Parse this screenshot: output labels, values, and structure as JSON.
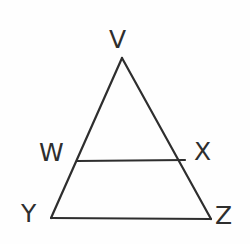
{
  "figure": {
    "kind": "geometry-diagram",
    "background_color": "#fefefe",
    "stroke_color": "#2e2e2e",
    "stroke_width": 2,
    "label_color": "#2e2e2e",
    "label_font_size": 25,
    "canvas": {
      "width": 250,
      "height": 244
    },
    "points": [
      {
        "id": "V",
        "label": "V",
        "x": 122,
        "y": 58,
        "label_x": 109,
        "label_y": 27
      },
      {
        "id": "W",
        "label": "W",
        "x": 77,
        "y": 161,
        "label_x": 39,
        "label_y": 140
      },
      {
        "id": "X",
        "label": "X",
        "x": 185,
        "y": 160,
        "label_x": 194,
        "label_y": 139
      },
      {
        "id": "Y",
        "label": "Y",
        "x": 51,
        "y": 218,
        "label_x": 21,
        "label_y": 201
      },
      {
        "id": "Z",
        "label": "Z",
        "x": 211,
        "y": 219,
        "label_x": 215,
        "label_y": 203
      }
    ],
    "segments": [
      {
        "id": "V-Y",
        "from": "V",
        "to": "Y",
        "d": "M 122 58 L 51 218"
      },
      {
        "id": "V-Z",
        "from": "V",
        "to": "Z",
        "d": "M 122 58 L 211 219"
      },
      {
        "id": "W-X",
        "from": "W",
        "to": "X",
        "d": "M 77 161 L 185 160"
      },
      {
        "id": "Y-Z",
        "from": "Y",
        "to": "Z",
        "d": "M 51 218 L 211 219"
      }
    ]
  }
}
